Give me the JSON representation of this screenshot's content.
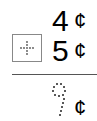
{
  "problem": {
    "addend1": "4",
    "addend2": "5",
    "operator": "+",
    "operator_icon": "dotted-plus-icon",
    "sum": "9",
    "sum_style": "dotted-trace",
    "unit": "¢"
  }
}
